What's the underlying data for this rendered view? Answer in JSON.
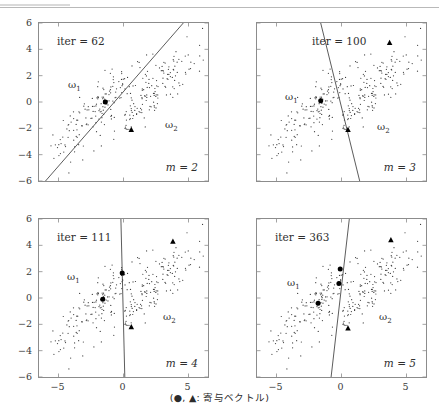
{
  "figure": {
    "caption": "(●, ▲: 寄与ベクトル)",
    "axis": {
      "y_ticks": [
        "6",
        "4",
        "2",
        "0",
        "−2",
        "−4",
        "−6"
      ],
      "y_values": [
        6,
        4,
        2,
        0,
        -2,
        -4,
        -6
      ],
      "x_ticks": [
        "−5",
        "0",
        "5"
      ],
      "x_values": [
        -5,
        0,
        5
      ]
    }
  },
  "chart_data": {
    "type": "scatter",
    "title": "",
    "xlabel": "",
    "ylabel": "",
    "xlim": [
      -6.5,
      6.5
    ],
    "ylim": [
      -6,
      6
    ],
    "grid": false,
    "legend": "(●, ▲: 寄与ベクトル)",
    "class_labels": [
      "ω₁",
      "ω₂"
    ],
    "panels": [
      {
        "id": "panel-1",
        "iter_label": "iter = 62",
        "iter": 62,
        "m_label": "m = 2",
        "m": 2,
        "omega1_label": "ω",
        "omega1_sub": "1",
        "omega2_label": "ω",
        "omega2_sub": "2",
        "boundary": {
          "type": "line",
          "p1": [
            -6.0,
            -6.0
          ],
          "p2": [
            4.6,
            6.0
          ]
        },
        "support_circles": [
          [
            -1.4,
            0.0
          ]
        ],
        "support_triangles": [
          [
            0.6,
            -2.1
          ]
        ]
      },
      {
        "id": "panel-2",
        "iter_label": "iter = 100",
        "iter": 100,
        "m_label": "m = 3",
        "m": 3,
        "omega1_label": "ω",
        "omega1_sub": "1",
        "omega2_label": "ω",
        "omega2_sub": "2",
        "boundary": {
          "type": "line",
          "p1": [
            -1.6,
            6.0
          ],
          "p2": [
            1.5,
            -6.4
          ]
        },
        "support_circles": [
          [
            -1.6,
            0.1
          ]
        ],
        "support_triangles": [
          [
            0.5,
            -2.1
          ],
          [
            3.7,
            4.5
          ]
        ]
      },
      {
        "id": "panel-3",
        "iter_label": "iter = 111",
        "iter": 111,
        "m_label": "m = 4",
        "m": 4,
        "omega1_label": "ω",
        "omega1_sub": "1",
        "omega2_label": "ω",
        "omega2_sub": "2",
        "boundary": {
          "type": "line",
          "p1": [
            -0.2,
            6.0
          ],
          "p2": [
            0.1,
            -6.0
          ]
        },
        "support_circles": [
          [
            -1.6,
            -0.1
          ],
          [
            -0.1,
            1.9
          ]
        ],
        "support_triangles": [
          [
            0.6,
            -2.2
          ],
          [
            3.8,
            4.3
          ]
        ]
      },
      {
        "id": "panel-4",
        "iter_label": "iter = 363",
        "iter": 363,
        "m_label": "m = 5",
        "m": 5,
        "omega1_label": "ω",
        "omega1_sub": "1",
        "omega2_label": "ω",
        "omega2_sub": "2",
        "boundary": {
          "type": "line",
          "p1": [
            0.6,
            6.0
          ],
          "p2": [
            -0.8,
            -6.0
          ]
        },
        "support_circles": [
          [
            -1.8,
            -0.4
          ],
          [
            -0.2,
            1.1
          ],
          [
            -0.1,
            2.2
          ]
        ],
        "support_triangles": [
          [
            0.5,
            -2.3
          ],
          [
            3.8,
            4.4
          ]
        ]
      }
    ],
    "cluster_omega1": {
      "center": [
        -2.1,
        -0.6
      ],
      "angle_deg": 45,
      "major_sd": 2.6,
      "minor_sd": 0.62,
      "n_points": 150
    },
    "cluster_omega2": {
      "center": [
        2.2,
        0.6
      ],
      "angle_deg": 45,
      "major_sd": 2.6,
      "minor_sd": 0.62,
      "n_points": 150
    }
  }
}
